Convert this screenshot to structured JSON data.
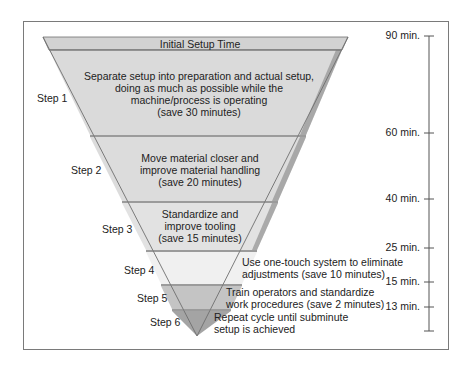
{
  "funnel": {
    "header": "Initial Setup Time",
    "steps": [
      {
        "label": "Step 1",
        "lines": [
          "Separate setup into preparation and actual setup,",
          "doing as much as possible while the",
          "machine/process is operating",
          "(save 30 minutes)"
        ]
      },
      {
        "label": "Step 2",
        "lines": [
          "Move material closer and",
          "improve material handling",
          "(save 20 minutes)"
        ]
      },
      {
        "label": "Step 3",
        "lines": [
          "Standardize and",
          "improve tooling",
          "(save 15 minutes)"
        ]
      },
      {
        "label": "Step 4",
        "lines": [
          "Use one-touch system to eliminate",
          "adjustments (save 10 minutes)"
        ]
      },
      {
        "label": "Step 5",
        "lines": [
          "Train operators and standardize",
          "work procedures (save 2 minutes)"
        ]
      },
      {
        "label": "Step 6",
        "lines": [
          "Repeat cycle until subminute",
          "setup is achieved"
        ]
      }
    ],
    "colors": {
      "header": "#d4d4d4",
      "band": "#dcdcdc",
      "band_light": "#ececec",
      "band_dark": "#b9b9b9",
      "edge_shadow": "#9a9a9a",
      "outline": "#6e6e6e"
    }
  },
  "scale": {
    "ticks": [
      {
        "label": "90 min."
      },
      {
        "label": "60 min."
      },
      {
        "label": "40 min."
      },
      {
        "label": "25 min."
      },
      {
        "label": "15 min."
      },
      {
        "label": "13 min."
      }
    ]
  }
}
